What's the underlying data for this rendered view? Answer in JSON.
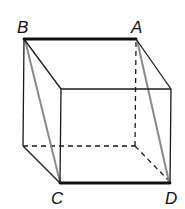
{
  "diagram": {
    "title": "",
    "type": "cube-with-diagonal-plane",
    "labels": {
      "A": "A",
      "B": "B",
      "C": "C",
      "D": "D"
    },
    "colors": {
      "edge": "#1a1a1a",
      "diagonal": "#8a8a8a",
      "background": "#ffffff"
    }
  }
}
